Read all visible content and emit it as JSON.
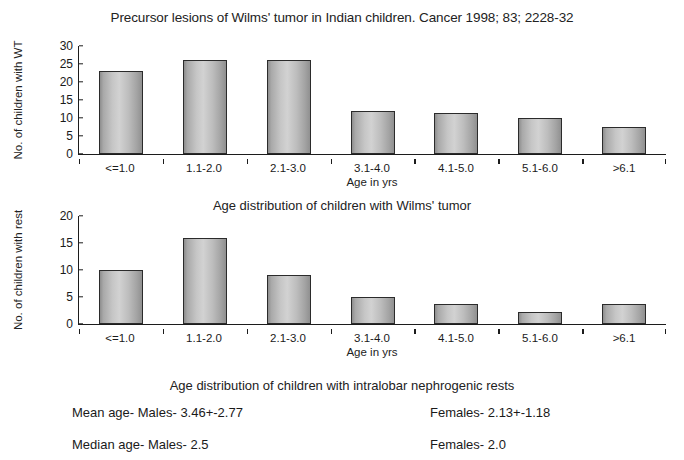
{
  "figure": {
    "title": "Precursor lesions of Wilms' tumor in Indian children. Cancer 1998; 83; 2228-32"
  },
  "captions": {
    "chart1": "Age distribution of children with Wilms' tumor",
    "chart2": "Age distribution of children with intralobar nephrogenic rests"
  },
  "stats": {
    "mean_left": "Mean age- Males- 3.46+-2.77",
    "mean_right": "Females- 2.13+-1.18",
    "median_left": "Median age- Males- 2.5",
    "median_right": "Females- 2.0"
  },
  "chart_data": [
    {
      "type": "bar",
      "title": "Age distribution of children with Wilms' tumor",
      "categories": [
        "<=1.0",
        "1.1-2.0",
        "2.1-3.0",
        "3.1-4.0",
        "4.1-5.0",
        "5.1-6.0",
        ">6.1"
      ],
      "values": [
        23,
        26,
        26,
        12,
        11.5,
        10,
        7.5
      ],
      "xlabel": "Age in yrs",
      "ylabel": "No. of children with WT",
      "ylim": [
        0,
        30
      ],
      "yticks": [
        0,
        5,
        10,
        15,
        20,
        25,
        30
      ],
      "grid": false,
      "legend": "none"
    },
    {
      "type": "bar",
      "title": "Age distribution of children with intralobar nephrogenic rests",
      "categories": [
        "<=1.0",
        "1.1-2.0",
        "2.1-3.0",
        "3.1-4.0",
        "4.1-5.0",
        "5.1-6.0",
        ">6.1"
      ],
      "values": [
        10,
        16,
        9,
        5,
        3.7,
        2.2,
        3.7
      ],
      "xlabel": "Age in yrs",
      "ylabel": "No. of children with rest",
      "ylim": [
        0,
        20
      ],
      "yticks": [
        0,
        5,
        10,
        15,
        20
      ],
      "grid": false,
      "legend": "none"
    }
  ]
}
